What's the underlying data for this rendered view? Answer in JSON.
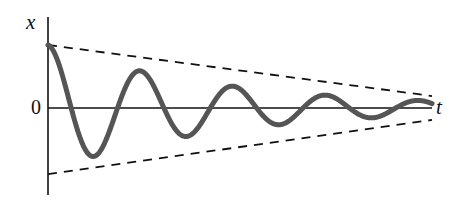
{
  "figure": {
    "kind": "damped-oscillation-plot",
    "width": 452,
    "height": 208,
    "background": "#ffffff"
  },
  "labels": {
    "y_axis": "x",
    "x_axis": "t",
    "origin": "0"
  },
  "colors": {
    "curve": "#555555",
    "axis": "#111111",
    "envelope": "#111111",
    "background": "#ffffff"
  },
  "geometry": {
    "origin_px": [
      48,
      108
    ],
    "y_axis_top_px": 17,
    "y_axis_bottom_px": 195,
    "x_axis_right_px": 432,
    "curve_stroke_width": 5,
    "axis_stroke_width": 1.6,
    "envelope_stroke_width": 1.8,
    "envelope_dash": "9 7"
  },
  "chart_data": {
    "type": "line",
    "title": "",
    "xlabel": "t",
    "ylabel": "x",
    "grid": false,
    "legend": null,
    "xlim": [
      0,
      1
    ],
    "ylim": [
      -1.06,
      1.06
    ],
    "series": [
      {
        "name": "damped oscillation x(t)",
        "style": "solid",
        "color": "#555555",
        "model": {
          "form": "A0 * exp(-t/tau) * cos(2*pi*t/T)",
          "A0": 1.0,
          "tau": 0.455,
          "T": 0.2415,
          "phase": 0.0
        },
        "peaks": [
          {
            "t": 0.0,
            "x": 1.0
          },
          {
            "t": 0.239,
            "x": 0.667
          },
          {
            "t": 0.481,
            "x": 0.444
          },
          {
            "t": 0.734,
            "x": 0.286
          },
          {
            "t": 0.969,
            "x": 0.175
          }
        ],
        "troughs": [
          {
            "t": 0.12,
            "x": -0.841
          },
          {
            "t": 0.364,
            "x": -0.635
          },
          {
            "t": 0.606,
            "x": -0.397
          },
          {
            "t": 0.854,
            "x": -0.238
          },
          {
            "t": 1.0,
            "x": -0.127
          }
        ],
        "zero_crossings_t": [
          0.06,
          0.18,
          0.301,
          0.422,
          0.543,
          0.664,
          0.787,
          0.908
        ]
      },
      {
        "name": "upper envelope",
        "style": "dashed",
        "color": "#111111",
        "points": [
          {
            "t": 0.0,
            "x": 1.0
          },
          {
            "t": 1.0,
            "x": 0.19
          }
        ]
      },
      {
        "name": "lower envelope",
        "style": "dashed",
        "color": "#111111",
        "points": [
          {
            "t": 0.0,
            "x": -1.048
          },
          {
            "t": 1.0,
            "x": -0.19
          }
        ]
      }
    ]
  }
}
